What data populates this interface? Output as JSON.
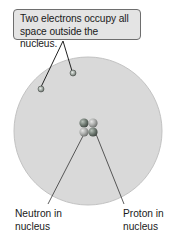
{
  "callout": {
    "line1": "Two electrons occupy all",
    "line2": "space outside the nucleus."
  },
  "labels": {
    "neutron": {
      "line1": "Neutron in",
      "line2": "nucleus"
    },
    "proton": {
      "line1": "Proton in",
      "line2": "nucleus"
    }
  },
  "colors": {
    "electron_cloud": "#d9d9d9",
    "cloud_edge": "#c2c2c2",
    "neutron": "#6f7a72",
    "proton": "#a9aba9",
    "electron": "#9aa29c",
    "leader_line": "#222222"
  },
  "atom": {
    "electrons": 2,
    "protons": 2,
    "neutrons": 2
  }
}
